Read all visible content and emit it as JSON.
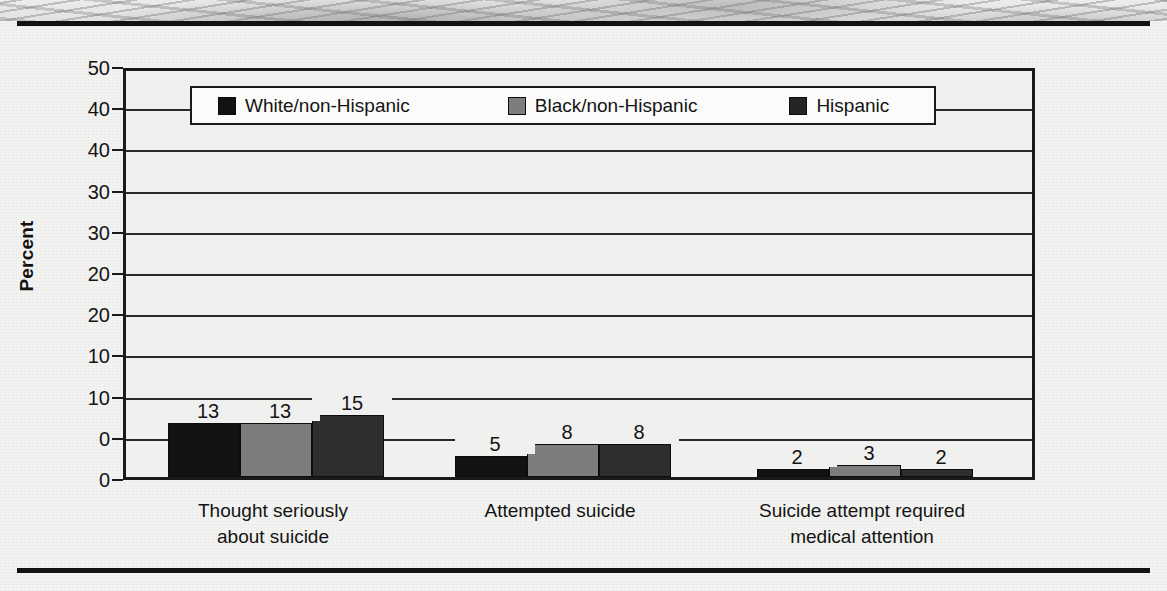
{
  "figure": {
    "y_axis_title": "Percent",
    "y_tick_labels": [
      "50",
      "40",
      "40",
      "30",
      "30",
      "20",
      "20",
      "10",
      "10",
      "0",
      "0"
    ],
    "legend": [
      {
        "label": "White/non-Hispanic",
        "swatch": "legend-swatch-black",
        "color": "#121212"
      },
      {
        "label": "Black/non-Hispanic",
        "swatch": "legend-swatch-gray",
        "color": "#7d7d7d"
      },
      {
        "label": "Hispanic",
        "swatch": "legend-swatch-dark",
        "color": "#242424"
      }
    ],
    "categories": [
      "Thought seriously\nabout suicide",
      "Attempted suicide",
      "Suicide attempt required\nmedical attention"
    ]
  },
  "chart_data": {
    "type": "bar",
    "title": "",
    "xlabel": "",
    "ylabel": "Percent",
    "ylim": [
      0,
      50
    ],
    "grid": true,
    "legend_position": "top-inside",
    "categories": [
      "Thought seriously about suicide",
      "Attempted suicide",
      "Suicide attempt required medical attention"
    ],
    "tick_labels_as_printed": [
      "50",
      "40",
      "40",
      "30",
      "30",
      "20",
      "20",
      "10",
      "10",
      "0",
      "0"
    ],
    "series": [
      {
        "name": "White/non-Hispanic",
        "color": "#121212",
        "values": [
          13,
          5,
          2
        ]
      },
      {
        "name": "Black/non-Hispanic",
        "color": "#7d7d7d",
        "values": [
          13,
          8,
          3
        ]
      },
      {
        "name": "Hispanic",
        "color": "#2e2e2e",
        "values": [
          15,
          8,
          2
        ]
      }
    ],
    "data_labels": [
      [
        "13",
        "13",
        "15"
      ],
      [
        "5",
        "8",
        "8"
      ],
      [
        "2",
        "3",
        "2"
      ]
    ]
  }
}
